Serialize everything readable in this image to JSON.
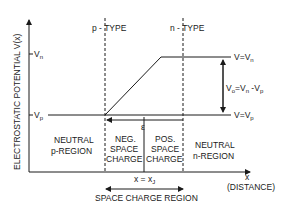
{
  "diagram": {
    "y_axis_label": "ELECTROSTATIC POTENTIAL  V(x)",
    "x_axis_label": "x",
    "x_axis_sublabel": "(DISTANCE)",
    "tick_vn": "V",
    "tick_vn_sub": "n",
    "tick_vp": "V",
    "tick_vp_sub": "p",
    "p_type_label": "p - TYPE",
    "n_type_label": "n - TYPE",
    "v_eq_vn": "V=V",
    "v_eq_vn_sub": "n",
    "v_eq_vp": "V=V",
    "v_eq_vp_sub": "p",
    "v0_label": "V",
    "v0_sub": "o",
    "v0_eq": "=V",
    "v0_eq_sub_n": "n",
    "v0_minus": " -V",
    "v0_minus_sub": "p",
    "field_label": "ε",
    "regions": {
      "neutral_p_line1": "NEUTRAL",
      "neutral_p_line2": "p-REGION",
      "neg_line1": "NEG.",
      "neg_line2": "SPACE",
      "neg_line3": "CHARGE",
      "pos_line1": "POS.",
      "pos_line2": "SPACE",
      "pos_line3": "CHARGE",
      "neutral_n_line1": "NEUTRAL",
      "neutral_n_line2": "n-REGION"
    },
    "junction_label": "x = x",
    "junction_sub": "J",
    "space_charge_region": "SPACE CHARGE REGION"
  }
}
